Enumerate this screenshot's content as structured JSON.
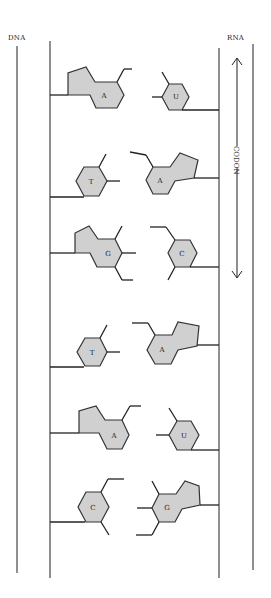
{
  "labels": {
    "dna": "DNA",
    "rna": "RNA",
    "codon": "CODON"
  },
  "pairs": [
    {
      "dna_base": "A",
      "rna_base": "U"
    },
    {
      "dna_base": "T",
      "rna_base": "A"
    },
    {
      "dna_base": "G",
      "rna_base": "C"
    },
    {
      "dna_base": "T",
      "rna_base": "A"
    },
    {
      "dna_base": "A",
      "rna_base": "U"
    },
    {
      "dna_base": "C",
      "rna_base": "G"
    }
  ],
  "colors": {
    "base_fill": "#d0d0d0",
    "line": "#333333"
  }
}
